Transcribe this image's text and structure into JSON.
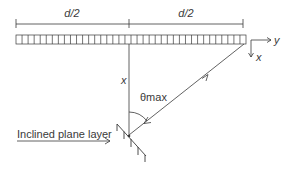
{
  "diagram": {
    "dimension_left_label": "d/2",
    "dimension_right_label": "d/2",
    "axis_y_label": "y",
    "axis_x_label": "x",
    "depth_label": "x",
    "angle_label": "θmax",
    "pointer_label": "Inclined plane layer",
    "array_cell_count": 38,
    "colors": {
      "line": "#3a3a3a",
      "background": "#ffffff"
    }
  }
}
